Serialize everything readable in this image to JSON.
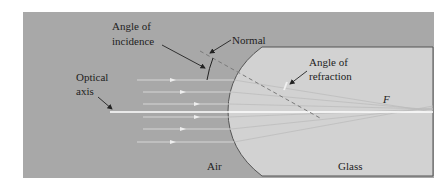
{
  "labels": {
    "angle_of_incidence_line1": "Angle of",
    "angle_of_incidence_line2": "incidence",
    "normal": "Normal",
    "angle_of_refraction_line1": "Angle of",
    "angle_of_refraction_line2": "refraction",
    "optical_axis_line1": "Optical",
    "optical_axis_line2": "axis",
    "focal_point": "F",
    "air": "Air",
    "glass": "Glass"
  },
  "colors": {
    "background": "#ffffff",
    "air": "#a8a8a8",
    "glass": "#d2d2d2",
    "glass_outline": "#555555",
    "ray": "#e6e6e6",
    "axis": "#ffffff",
    "normal_dash": "#7a7a7a",
    "text": "#222222"
  }
}
